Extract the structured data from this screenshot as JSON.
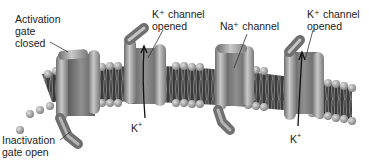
{
  "diagram": {
    "labels": {
      "activation_gate": "Activation\ngate\nclosed",
      "k_channel_1": "K⁺ channel\nopened",
      "na_channel": "Na⁺ channel",
      "k_channel_2": "K⁺ channel\nopened",
      "inactivation_gate": "Inactivation\ngate open"
    },
    "ions": {
      "k1": "K",
      "k2": "K",
      "charge": "+"
    },
    "colors": {
      "membrane": "#3a3a3a",
      "phospholipid_head": "#9a9a9a",
      "channel_protein": "#8e8e8e",
      "channel_highlight": "#c8c8c8",
      "text": "#222222"
    }
  }
}
